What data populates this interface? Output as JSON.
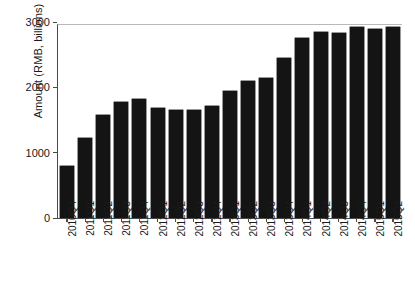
{
  "chart_data": {
    "type": "bar",
    "title": "",
    "subtitle": "",
    "xlabel": "",
    "ylabel": "Amount (RMB, billions)",
    "ylim": [
      0,
      3000
    ],
    "yticks": [
      "0",
      "1000",
      "2000",
      "3000"
    ],
    "ytick_values": [
      0,
      1000,
      2000,
      3000
    ],
    "grid": false,
    "legend": null,
    "bar_color": "#141414",
    "axis_color": "#4a4a4a",
    "categories": [
      "2010Q4",
      "2011Q1",
      "2011Q2",
      "2011Q3",
      "2011Q4",
      "2012Q1",
      "2012Q2",
      "2012Q3",
      "2012Q4",
      "2013Q1",
      "2013Q2",
      "2013Q3",
      "2013Q4",
      "2014Q1",
      "2014Q2",
      "2014Q3",
      "2014Q4",
      "2015Q1",
      "2015Q2"
    ],
    "values": [
      800,
      1230,
      1570,
      1780,
      1820,
      1690,
      1650,
      1650,
      1720,
      1940,
      2090,
      2140,
      2450,
      2760,
      2850,
      2830,
      2920,
      2900,
      2930
    ]
  }
}
